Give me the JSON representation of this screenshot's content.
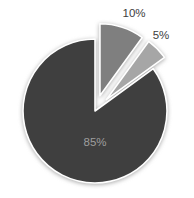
{
  "chart_data": {
    "type": "pie",
    "title": "",
    "legend": false,
    "background": "#ffffff",
    "start_angle_deg": 0,
    "direction": "clockwise",
    "label_format": "percent",
    "slices": [
      {
        "label": "10%",
        "value": 10,
        "color": "#7f7f7f",
        "exploded": true,
        "label_position": "outside",
        "label_color": "#3d3d3d"
      },
      {
        "label": "5%",
        "value": 5,
        "color": "#a6a6a6",
        "exploded": true,
        "label_position": "outside",
        "label_color": "#3d3d3d"
      },
      {
        "label": "85%",
        "value": 85,
        "color": "#3f3f3f",
        "exploded": false,
        "label_position": "inside",
        "label_color": "#9e9e9e"
      }
    ]
  }
}
